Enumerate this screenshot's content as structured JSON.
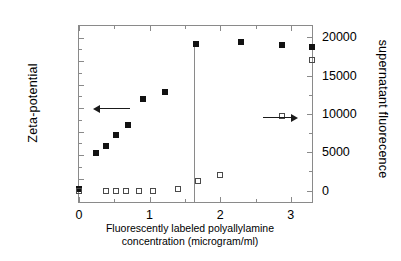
{
  "chart_data": {
    "type": "scatter",
    "title": "",
    "xlabel": "Fluorescently labeled polyallylamine concentration (microgram/ml)",
    "xlabel_line1": "Fluorescently labeled polyallylamine",
    "xlabel_line2": "concentration (microgram/ml)",
    "ylabel_left": "Zeta-potential",
    "ylabel_right": "supernatant fluorecence",
    "xlim": [
      0,
      3.3
    ],
    "ylim_left": [
      -80,
      70
    ],
    "ylim_right": [
      -1500,
      21500
    ],
    "grid": false,
    "legend": "none",
    "xticks": [
      0,
      1,
      2,
      3
    ],
    "xtick_labels": [
      "0",
      "1",
      "2",
      "3"
    ],
    "yticks_left": [
      60,
      40,
      20,
      0,
      -20,
      -40,
      -60,
      -80
    ],
    "ytick_labels_left": [
      "60",
      "40",
      "20",
      "0",
      "-20",
      "-40",
      "-60",
      "-80"
    ],
    "yticks_right": [
      0,
      5000,
      10000,
      15000,
      20000
    ],
    "ytick_labels_right": [
      "0",
      "5000",
      "10000",
      "15000",
      "20000"
    ],
    "series": [
      {
        "name": "Zeta-potential",
        "axis": "left",
        "marker": "filled-square",
        "color": "#121212",
        "x": [
          0,
          0.24,
          0.38,
          0.52,
          0.7,
          0.9,
          1.22,
          1.65,
          2.3,
          2.87,
          3.3
        ],
        "y": [
          -69,
          -38,
          -32,
          -23,
          -14.5,
          8,
          14,
          55,
          56,
          54,
          52
        ]
      },
      {
        "name": "supernatant fluorecence",
        "axis": "right",
        "marker": "open-square",
        "color": "#4a4a4a",
        "x": [
          0,
          0.38,
          0.52,
          0.66,
          0.85,
          1.05,
          1.4,
          1.68,
          2.0,
          2.87,
          3.3
        ],
        "y": [
          -120,
          0,
          0,
          0,
          0,
          0,
          150,
          1200,
          2000,
          9800,
          17100
        ]
      }
    ],
    "annotations": [
      {
        "name": "left-axis-arrow",
        "type": "arrow",
        "direction": "left",
        "x_start": 0.72,
        "x_end": 0.29,
        "y_left": 0
      },
      {
        "name": "right-axis-arrow",
        "type": "arrow",
        "direction": "right",
        "x_start": 2.6,
        "x_end": 3.02,
        "y_right": 9600
      },
      {
        "name": "transition-vertical-line",
        "type": "vline",
        "x": 1.625,
        "y_top_left": 55,
        "y_bottom_left": -80
      }
    ]
  }
}
